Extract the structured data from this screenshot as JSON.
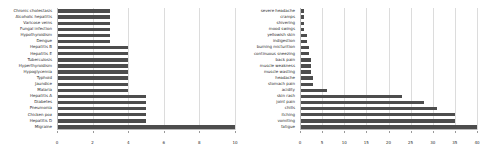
{
  "chart_data": [
    {
      "type": "bar",
      "orientation": "horizontal",
      "panel": "left",
      "title": "",
      "xlabel": "",
      "ylabel": "",
      "xlim": [
        0,
        10
      ],
      "xticks": [
        0,
        2,
        4,
        6,
        8,
        10
      ],
      "grid": true,
      "bar_color": "#4d4d4d",
      "categories": [
        "Chronic cholestasis",
        "Alcoholic hepatitis",
        "Varicose veins",
        "Fungal infection",
        "Hypothyroidism",
        "Dengue",
        "Hepatitis B",
        "Hepatitis E",
        "Tuberculosis",
        "Hyperthyroidism",
        "Hypoglycemia",
        "Typhoid",
        "Jaundice",
        "Malaria",
        "Hepatitis A",
        "Diabetes",
        "Pneumonia",
        "Chicken pox",
        "Hepatitis D",
        "Migraine"
      ],
      "values": [
        3,
        3,
        3,
        3,
        3,
        3,
        4,
        4,
        4,
        4,
        4,
        4,
        4,
        4,
        5,
        5,
        5,
        5,
        5,
        10
      ]
    },
    {
      "type": "bar",
      "orientation": "horizontal",
      "panel": "right",
      "title": "",
      "xlabel": "",
      "ylabel": "",
      "xlim": [
        0,
        40
      ],
      "xticks": [
        0,
        5,
        10,
        15,
        20,
        25,
        30,
        35,
        40
      ],
      "grid": true,
      "bar_color": "#4d4d4d",
      "categories": [
        "severe headache",
        "cramps",
        "shivering",
        "mood swings",
        "yellowish skin",
        "indigestion",
        "burning micturition",
        "continuous sneezing",
        "back pain",
        "muscle weakness",
        "muscle wasting",
        "headache",
        "stomach pain",
        "acidity",
        "skin rash",
        "joint pain",
        "chills",
        "itching",
        "vomiting",
        "fatigue"
      ],
      "values": [
        1,
        1,
        1,
        1,
        1.5,
        1.5,
        2,
        2,
        2.5,
        2.5,
        2.5,
        3,
        3,
        6,
        23,
        28,
        31,
        35,
        35,
        40
      ]
    }
  ]
}
